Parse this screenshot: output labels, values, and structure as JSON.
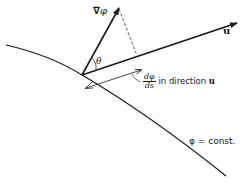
{
  "diagram": {
    "labels": {
      "gradient": {
        "nabla": "∇",
        "symbol": "φ"
      },
      "angle": "θ",
      "unit_vector": "u",
      "derivative": {
        "numerator": "dφ",
        "denominator": "ds",
        "suffix": " in direction ",
        "direction": "u"
      },
      "level_curve": "φ = const."
    },
    "colors": {
      "ink": "#1a1a1a",
      "background": "#ffffff"
    }
  }
}
